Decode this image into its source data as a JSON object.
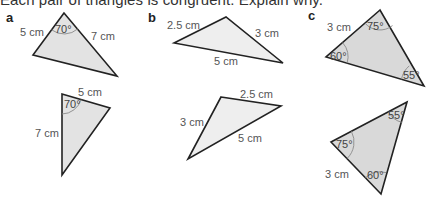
{
  "instruction": "Each pair of triangles is congruent. Explain why.",
  "colors": {
    "fill_a": "#e3e3e3",
    "fill_b": "#eeeeee",
    "fill_c": "#d9d9d9",
    "stroke": "#222222",
    "label_text": "#555555"
  },
  "parts": [
    {
      "label": "a",
      "triangles": [
        {
          "sides": [
            "5 cm",
            "7 cm"
          ],
          "angles": [
            "70°"
          ]
        },
        {
          "sides": [
            "5 cm",
            "7 cm"
          ],
          "angles": [
            "70°"
          ]
        }
      ]
    },
    {
      "label": "b",
      "triangles": [
        {
          "sides": [
            "2.5 cm",
            "3 cm",
            "5 cm"
          ],
          "angles": []
        },
        {
          "sides": [
            "2.5 cm",
            "3 cm",
            "5 cm"
          ],
          "angles": []
        }
      ]
    },
    {
      "label": "c",
      "triangles": [
        {
          "sides": [
            "3 cm"
          ],
          "angles": [
            "75°",
            "60°",
            "55°"
          ]
        },
        {
          "sides": [
            "3 cm"
          ],
          "angles": [
            "55°",
            "75°",
            "60°"
          ]
        }
      ]
    }
  ]
}
